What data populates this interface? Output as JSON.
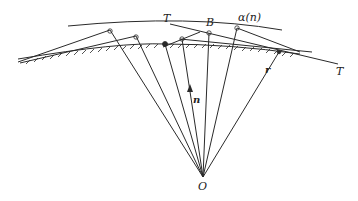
{
  "diagram": {
    "labels": {
      "tangent_left": "T",
      "point_b": "B",
      "curve": "α(n)",
      "tangent_right": "T",
      "normal": "n",
      "radius": "r",
      "origin": "O"
    },
    "colors": {
      "stroke": "#2a2a2a",
      "background": "#ffffff"
    }
  }
}
